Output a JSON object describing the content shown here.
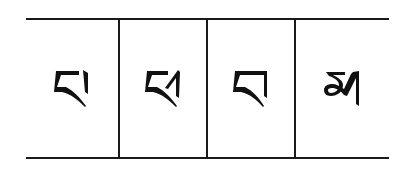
{
  "table": {
    "cells": [
      {
        "char": "པ",
        "name": "pa"
      },
      {
        "char": "ཕ",
        "name": "pha"
      },
      {
        "char": "བ",
        "name": "ba"
      },
      {
        "char": "མ",
        "name": "ma"
      }
    ]
  },
  "colors": {
    "line": "#1a1a1a",
    "glyph": "#111111",
    "background": "#ffffff"
  }
}
